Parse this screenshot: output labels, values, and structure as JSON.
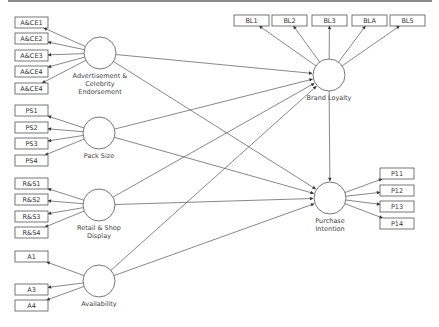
{
  "diagram": {
    "type": "structural-equation-path-model",
    "colors": {
      "line": "#555555",
      "top_bar": "#8a8a8a",
      "box_border": "#555555",
      "text": "#333333"
    },
    "latents": [
      {
        "id": "ace",
        "label_lines": [
          "Advertisement &",
          "Celebrity",
          "Endorsement"
        ],
        "cx": 100,
        "cy": 53
      },
      {
        "id": "ps",
        "label_lines": [
          "Pack Size"
        ],
        "cx": 99,
        "cy": 133
      },
      {
        "id": "rsd",
        "label_lines": [
          "Retail & Shop",
          "Display"
        ],
        "cx": 99,
        "cy": 205
      },
      {
        "id": "av",
        "label_lines": [
          "Availability"
        ],
        "cx": 99,
        "cy": 281
      },
      {
        "id": "bl",
        "label_lines": [
          "Brand Loyalty"
        ],
        "cx": 329,
        "cy": 75
      },
      {
        "id": "pi",
        "label_lines": [
          "Purchase",
          "Intention"
        ],
        "cx": 330,
        "cy": 198
      }
    ],
    "indicators": [
      {
        "label": "A&CE1",
        "latent": "ace",
        "x": 15,
        "y": 17
      },
      {
        "label": "A&CE2",
        "latent": "ace",
        "x": 15,
        "y": 33
      },
      {
        "label": "A&CE3",
        "latent": "ace",
        "x": 15,
        "y": 50
      },
      {
        "label": "A&CE4",
        "latent": "ace",
        "x": 15,
        "y": 66
      },
      {
        "label": "A&CE4",
        "latent": "ace",
        "x": 15,
        "y": 83
      },
      {
        "label": "PS1",
        "latent": "ps",
        "x": 15,
        "y": 105
      },
      {
        "label": "PS2",
        "latent": "ps",
        "x": 15,
        "y": 122
      },
      {
        "label": "PS3",
        "latent": "ps",
        "x": 15,
        "y": 138
      },
      {
        "label": "PS4",
        "latent": "ps",
        "x": 15,
        "y": 155
      },
      {
        "label": "R&S1",
        "latent": "rsd",
        "x": 15,
        "y": 178
      },
      {
        "label": "R&S2",
        "latent": "rsd",
        "x": 15,
        "y": 194
      },
      {
        "label": "R&S3",
        "latent": "rsd",
        "x": 15,
        "y": 211
      },
      {
        "label": "R&S4",
        "latent": "rsd",
        "x": 15,
        "y": 227
      },
      {
        "label": "A1",
        "latent": "av",
        "x": 15,
        "y": 251
      },
      {
        "label": "A3",
        "latent": "av",
        "x": 15,
        "y": 284
      },
      {
        "label": "A4",
        "latent": "av",
        "x": 15,
        "y": 300
      },
      {
        "label": "BL1",
        "latent": "bl",
        "x": 234,
        "y": 15
      },
      {
        "label": "BL2",
        "latent": "bl",
        "x": 272,
        "y": 15
      },
      {
        "label": "BL3",
        "latent": "bl",
        "x": 312,
        "y": 15
      },
      {
        "label": "BLA",
        "latent": "bl",
        "x": 352,
        "y": 15
      },
      {
        "label": "BL5",
        "latent": "bl",
        "x": 390,
        "y": 15
      },
      {
        "label": "P11",
        "latent": "pi",
        "x": 380,
        "y": 168
      },
      {
        "label": "P12",
        "latent": "pi",
        "x": 380,
        "y": 185
      },
      {
        "label": "P13",
        "latent": "pi",
        "x": 380,
        "y": 201
      },
      {
        "label": "P14",
        "latent": "pi",
        "x": 380,
        "y": 218
      }
    ],
    "paths": [
      {
        "from": "ace",
        "to": "bl"
      },
      {
        "from": "ace",
        "to": "pi"
      },
      {
        "from": "ps",
        "to": "bl"
      },
      {
        "from": "ps",
        "to": "pi"
      },
      {
        "from": "rsd",
        "to": "bl"
      },
      {
        "from": "rsd",
        "to": "pi"
      },
      {
        "from": "av",
        "to": "bl"
      },
      {
        "from": "av",
        "to": "pi"
      },
      {
        "from": "bl",
        "to": "pi"
      }
    ]
  }
}
